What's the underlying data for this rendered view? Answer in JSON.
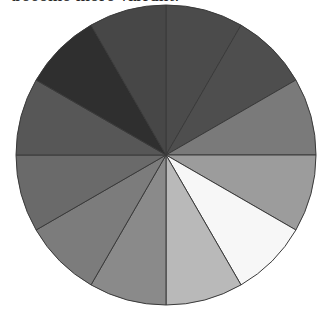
{
  "caption": {
    "text": "become more vibrant."
  },
  "chart_data": {
    "type": "pie",
    "title": "",
    "start_angle_deg": 0,
    "direction": "clockwise",
    "center": [
      166,
      155
    ],
    "radius": 150,
    "stroke": "#3a3a3a",
    "categories": [
      "1",
      "2",
      "3",
      "4",
      "5",
      "6",
      "7",
      "8",
      "9",
      "10",
      "11",
      "12"
    ],
    "values": [
      1,
      1,
      1,
      1,
      1,
      1,
      1,
      1,
      1,
      1,
      1,
      1
    ],
    "colors": [
      "#4b4b4b",
      "#4e4e4e",
      "#7a7a7a",
      "#9c9c9c",
      "#f7f7f7",
      "#b9b9b9",
      "#8a8a8a",
      "#7c7c7c",
      "#6a6a6a",
      "#575757",
      "#2f2f2f",
      "#474747"
    ],
    "legend": "none"
  }
}
